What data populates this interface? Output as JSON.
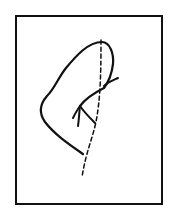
{
  "diagram": {
    "background": "#ffffff",
    "stroke_color": "#111111",
    "frame": {
      "x": 16,
      "y": 16,
      "width": 146,
      "height": 188,
      "stroke_width": 2
    },
    "fold_line": {
      "style": "dashed",
      "description": "valley fold line",
      "path": "M101,40 C101,80 100,100 96,122 C92,140 86,152 82,177"
    },
    "paper_edge": {
      "style": "solid",
      "path": "M83,154 C70,145 55,135 45,122 C38,112 40,104 47,96 C55,88 58,78 66,68 C76,56 88,42 102,42 C110,42 114,54 113,64 C112,72 110,80 104,88 C96,92 86,98 80,106"
    },
    "paper_edge_flick": {
      "path": "M104,86 C108,82 114,80 118,78"
    },
    "arrow": {
      "direction": "fold-in",
      "shaft": "M80,106 C84,112 90,118 95,123",
      "barb_left": "M80,106 C77,110 75,114 73,118",
      "barb_right": "M80,106 C79,114 79,120 78,126"
    }
  }
}
